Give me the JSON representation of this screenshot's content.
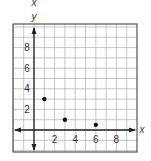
{
  "chart_data": {
    "type": "scatter",
    "title": "",
    "xlabel": "x",
    "ylabel": "y",
    "top_label": "x",
    "xlim": [
      -2,
      10
    ],
    "ylim": [
      -2,
      10
    ],
    "grid": true,
    "x_ticks": [
      2,
      4,
      6,
      8
    ],
    "y_ticks": [
      2,
      4,
      6,
      8
    ],
    "x": [
      1,
      3,
      6
    ],
    "y": [
      3,
      1,
      0.5
    ],
    "points": [
      {
        "x": 1,
        "y": 3
      },
      {
        "x": 3,
        "y": 1
      },
      {
        "x": 6,
        "y": 0.5
      }
    ],
    "colors": {
      "grid": "#b8b8b8",
      "frame": "#555555",
      "axis": "#222222",
      "point": "#111111"
    }
  }
}
